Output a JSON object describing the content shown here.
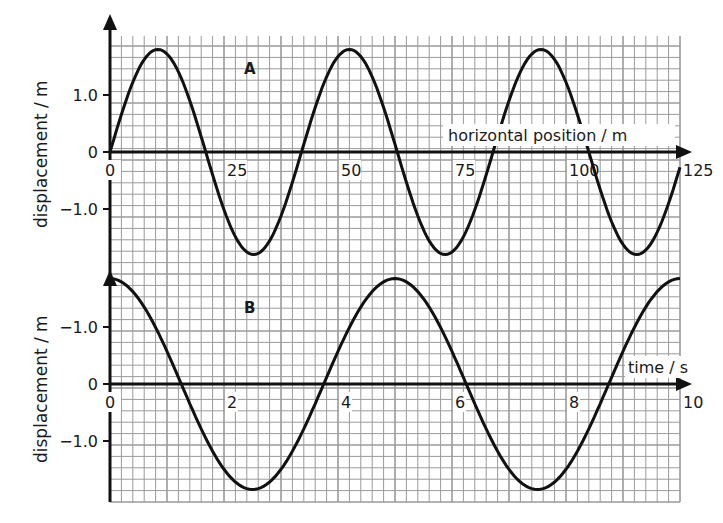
{
  "chart_data": [
    {
      "type": "line",
      "panel": "A",
      "title": "A",
      "xlabel": "horizontal position / m",
      "ylabel": "displacement / m",
      "xticks": [
        "0",
        "25",
        "50",
        "75",
        "100",
        "125"
      ],
      "yticks": [
        "1.0",
        "0",
        "-1.0"
      ],
      "xlim": [
        0,
        125
      ],
      "ylim": [
        -1.9,
        1.9
      ],
      "grid": true,
      "series": [
        {
          "name": "A",
          "function": "sine",
          "amplitude": 1.8,
          "wavelength": 42,
          "x": [
            0,
            10.5,
            21,
            31.5,
            42,
            52.5,
            63,
            73.5,
            84,
            94.5,
            105,
            115.5,
            125
          ],
          "values": [
            0,
            1.8,
            0,
            -1.8,
            0,
            1.8,
            0,
            -1.8,
            0,
            1.8,
            0,
            -1.8,
            -0.5
          ]
        }
      ]
    },
    {
      "type": "line",
      "panel": "B",
      "title": "B",
      "xlabel": "time / s",
      "ylabel": "displacement / m",
      "xticks": [
        "0",
        "2",
        "4",
        "6",
        "8",
        "10"
      ],
      "yticks": [
        "-1.0",
        "0",
        "-1.0"
      ],
      "xlim": [
        0,
        10
      ],
      "ylim": [
        -1.9,
        1.9
      ],
      "grid": true,
      "series": [
        {
          "name": "B",
          "function": "cosine",
          "amplitude": 1.85,
          "period": 5,
          "x": [
            0,
            1.25,
            2.5,
            3.75,
            5,
            6.25,
            7.5,
            8.75,
            10
          ],
          "values": [
            1.85,
            0,
            -1.85,
            0,
            1.85,
            0,
            -1.85,
            0,
            1.85
          ]
        }
      ]
    }
  ],
  "labels": {
    "panel_a": "A",
    "panel_b": "B",
    "a_xlabel": "horizontal position / m",
    "b_xlabel": "time / s",
    "ylabel": "displacement / m",
    "a_xticks": [
      "0",
      "25",
      "50",
      "75",
      "100",
      "125"
    ],
    "b_xticks": [
      "0",
      "2",
      "4",
      "6",
      "8",
      "10"
    ],
    "a_yticks": [
      "1.0",
      "0",
      "−1.0"
    ],
    "b_yticks": [
      "−1.0",
      "0",
      "−1.0"
    ]
  },
  "colors": {
    "grid": "#9a9a9a",
    "curve": "#111111",
    "axis": "#111111"
  }
}
